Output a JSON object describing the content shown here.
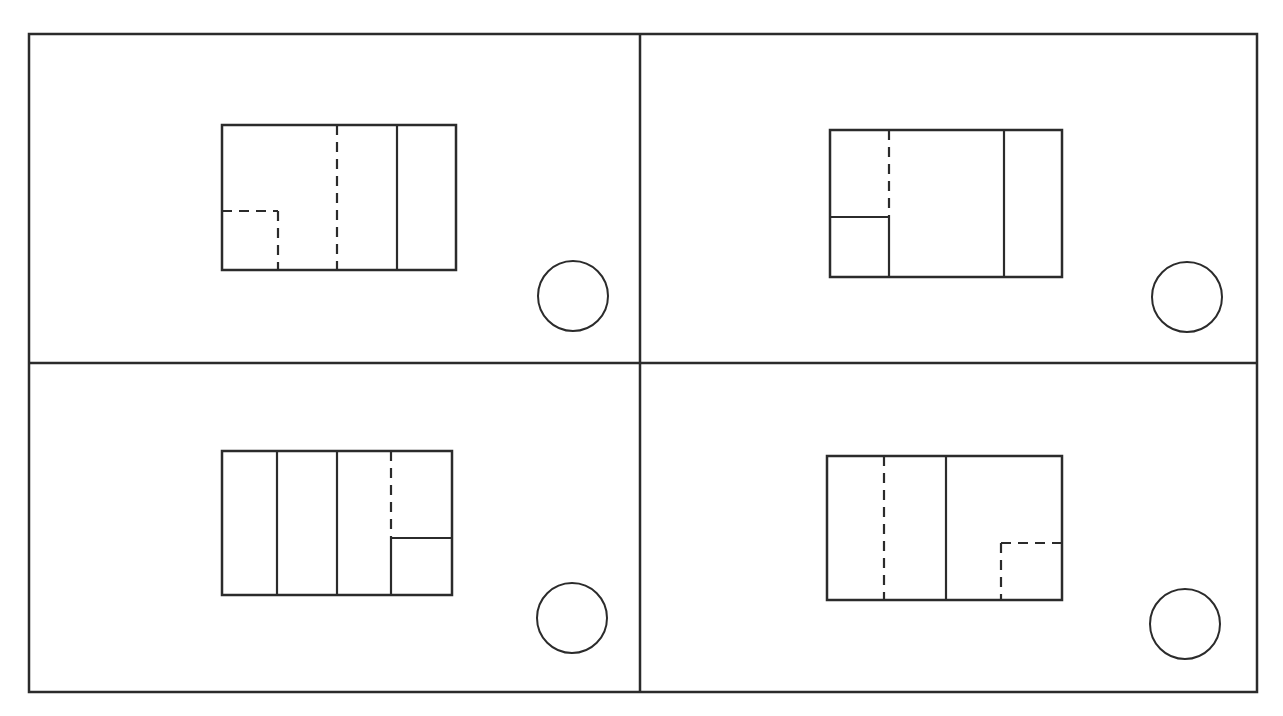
{
  "diagram": {
    "title": "",
    "stroke_color": "#2b2b2b",
    "background": "#ffffff",
    "frame": {
      "x1": 29,
      "y1": 34,
      "x2": 1257,
      "y2": 692,
      "divider_x": 640,
      "divider_y": 363
    },
    "panels": [
      {
        "id": "top-left",
        "rect": {
          "x1": 222,
          "y1": 125,
          "x2": 456,
          "y2": 270
        },
        "lines": [
          {
            "x1": 337,
            "y1": 125,
            "x2": 337,
            "y2": 270,
            "style": "dashed"
          },
          {
            "x1": 397,
            "y1": 125,
            "x2": 397,
            "y2": 270,
            "style": "solid"
          },
          {
            "x1": 222,
            "y1": 211,
            "x2": 278,
            "y2": 211,
            "style": "dashed"
          },
          {
            "x1": 278,
            "y1": 211,
            "x2": 278,
            "y2": 270,
            "style": "dashed"
          }
        ],
        "circle": {
          "cx": 573,
          "cy": 296,
          "r": 35
        }
      },
      {
        "id": "top-right",
        "rect": {
          "x1": 830,
          "y1": 130,
          "x2": 1062,
          "y2": 277
        },
        "lines": [
          {
            "x1": 889,
            "y1": 130,
            "x2": 889,
            "y2": 217,
            "style": "dashed"
          },
          {
            "x1": 830,
            "y1": 217,
            "x2": 889,
            "y2": 217,
            "style": "solid"
          },
          {
            "x1": 889,
            "y1": 217,
            "x2": 889,
            "y2": 277,
            "style": "solid"
          },
          {
            "x1": 1004,
            "y1": 130,
            "x2": 1004,
            "y2": 277,
            "style": "solid"
          }
        ],
        "circle": {
          "cx": 1187,
          "cy": 297,
          "r": 35
        }
      },
      {
        "id": "bottom-left",
        "rect": {
          "x1": 222,
          "y1": 451,
          "x2": 452,
          "y2": 595
        },
        "lines": [
          {
            "x1": 277,
            "y1": 451,
            "x2": 277,
            "y2": 595,
            "style": "solid"
          },
          {
            "x1": 337,
            "y1": 451,
            "x2": 337,
            "y2": 595,
            "style": "solid"
          },
          {
            "x1": 391,
            "y1": 451,
            "x2": 391,
            "y2": 538,
            "style": "dashed"
          },
          {
            "x1": 391,
            "y1": 538,
            "x2": 452,
            "y2": 538,
            "style": "solid"
          },
          {
            "x1": 391,
            "y1": 538,
            "x2": 391,
            "y2": 595,
            "style": "solid"
          }
        ],
        "circle": {
          "cx": 572,
          "cy": 618,
          "r": 35
        }
      },
      {
        "id": "bottom-right",
        "rect": {
          "x1": 827,
          "y1": 456,
          "x2": 1062,
          "y2": 600
        },
        "lines": [
          {
            "x1": 884,
            "y1": 456,
            "x2": 884,
            "y2": 600,
            "style": "dashed"
          },
          {
            "x1": 946,
            "y1": 456,
            "x2": 946,
            "y2": 600,
            "style": "solid"
          },
          {
            "x1": 1001,
            "y1": 543,
            "x2": 1062,
            "y2": 543,
            "style": "dashed"
          },
          {
            "x1": 1001,
            "y1": 543,
            "x2": 1001,
            "y2": 600,
            "style": "dashed"
          }
        ],
        "circle": {
          "cx": 1185,
          "cy": 624,
          "r": 35
        }
      }
    ]
  }
}
